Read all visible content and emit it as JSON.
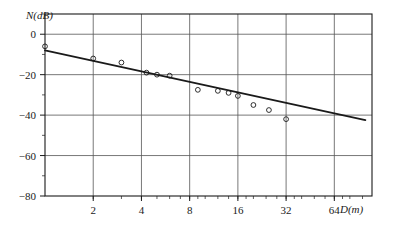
{
  "figure": {
    "name": "path-loss-vs-distance-plot",
    "background_color": "#ffffff",
    "ink_color": "#1a1a1a",
    "grid_color": "#555555"
  },
  "chart_data": {
    "type": "scatter",
    "title": "",
    "subtitle": "",
    "xlabel": "D(m)",
    "ylabel": "N(dB)",
    "x_scale": "log2",
    "xlim": [
      1,
      110
    ],
    "ylim": [
      -80,
      10
    ],
    "grid": true,
    "legend": null,
    "x_tick_labels": [
      "2",
      "4",
      "8",
      "16",
      "32",
      "64"
    ],
    "x_tick_values": [
      2,
      4,
      8,
      16,
      32,
      64
    ],
    "y_tick_labels": [
      "0",
      "-20",
      "-40",
      "-60",
      "-80"
    ],
    "y_tick_values": [
      0,
      -20,
      -40,
      -60,
      -80
    ],
    "series": [
      {
        "name": "measured-points",
        "type": "scatter",
        "marker": "open-circle",
        "points": [
          {
            "x": 1.0,
            "y": -6.0
          },
          {
            "x": 2.0,
            "y": -12.0
          },
          {
            "x": 3.0,
            "y": -14.0
          },
          {
            "x": 4.3,
            "y": -19.0
          },
          {
            "x": 5.0,
            "y": -20.0
          },
          {
            "x": 6.0,
            "y": -20.5
          },
          {
            "x": 9.0,
            "y": -27.5
          },
          {
            "x": 12.0,
            "y": -28.0
          },
          {
            "x": 14.0,
            "y": -29.0
          },
          {
            "x": 16.0,
            "y": -30.5
          },
          {
            "x": 20.0,
            "y": -35.0
          },
          {
            "x": 25.0,
            "y": -37.5
          },
          {
            "x": 32.0,
            "y": -42.0
          }
        ]
      },
      {
        "name": "regression-line",
        "type": "line",
        "endpoints": [
          {
            "x": 1.0,
            "y": -8.0
          },
          {
            "x": 100.0,
            "y": -42.5
          }
        ]
      }
    ]
  }
}
